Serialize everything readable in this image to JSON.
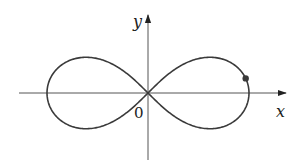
{
  "figure": {
    "type": "lemniscate",
    "axes": {
      "x_label": "x",
      "y_label": "y",
      "origin_label": "0"
    },
    "colors": {
      "curve": "#3a3a3a",
      "axes": "#555555",
      "point": "#3a3a3a",
      "background": "#ffffff"
    },
    "geometry": {
      "origin_px": [
        148,
        93
      ],
      "a_px": 101,
      "marked_point_param_t": 0.15
    }
  }
}
